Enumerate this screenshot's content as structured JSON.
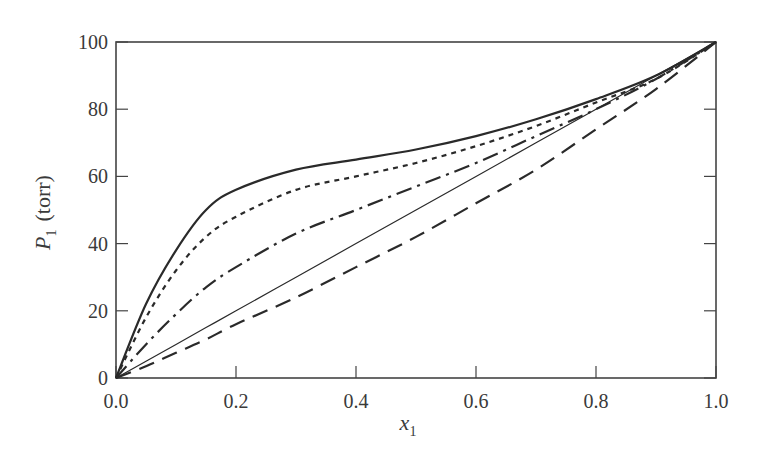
{
  "chart_data": {
    "type": "line",
    "title": "",
    "xlabel": "x_1",
    "ylabel": "P_1 (torr)",
    "xlim": [
      0.0,
      1.0
    ],
    "ylim": [
      0,
      100
    ],
    "grid": false,
    "legend": null,
    "x_ticks": [
      "0.0",
      "0.2",
      "0.4",
      "0.6",
      "0.8",
      "1.0"
    ],
    "y_ticks": [
      "0",
      "20",
      "40",
      "60",
      "80",
      "100"
    ],
    "x": [
      0.0,
      0.05,
      0.1,
      0.15,
      0.2,
      0.3,
      0.4,
      0.5,
      0.6,
      0.7,
      0.8,
      0.9,
      1.0
    ],
    "series": [
      {
        "name": "solid-thick",
        "style": "solid",
        "values": [
          0,
          22,
          38,
          50,
          56,
          62,
          65,
          68,
          72,
          77,
          83,
          90,
          100
        ]
      },
      {
        "name": "dotted",
        "style": "dotted",
        "values": [
          0,
          18,
          32,
          42,
          48,
          56,
          60,
          64,
          69,
          75,
          82,
          89,
          100
        ]
      },
      {
        "name": "dash-dot",
        "style": "dash-dot",
        "values": [
          0,
          10,
          19,
          27,
          33,
          43,
          50,
          57,
          64,
          72,
          80,
          89,
          100
        ]
      },
      {
        "name": "solid-thin (ideal/Raoult)",
        "style": "solid-thin",
        "values": [
          0,
          5,
          10,
          15,
          20,
          30,
          40,
          50,
          60,
          70,
          80,
          90,
          100
        ]
      },
      {
        "name": "dashed",
        "style": "dashed",
        "values": [
          0,
          3.5,
          7.5,
          11.5,
          16,
          24,
          33,
          42,
          52,
          62,
          74,
          86,
          100
        ]
      }
    ]
  },
  "axes": {
    "ylabel_main": "P",
    "ylabel_sub": "1",
    "ylabel_unit": "(torr)",
    "xlabel_main": "x",
    "xlabel_sub": "1"
  }
}
